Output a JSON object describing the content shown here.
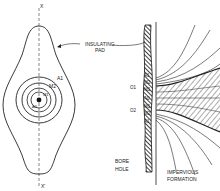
{
  "figure": {
    "left_view": {
      "axis_top_label": "X",
      "axis_bottom_label": "X'",
      "electrode_labels": [
        "A1",
        "M2",
        "M1",
        "A0"
      ]
    },
    "right_view": {
      "pad_label_line1": "INSULATING",
      "pad_label_line2": "PAD",
      "electrode_labels": [
        "A1",
        "M2",
        "O1",
        "M1",
        "A0",
        "M1",
        "O2",
        "M2",
        "A1"
      ],
      "borehole_line1": "BORE",
      "borehole_line2": "HOLE",
      "formation_line1": "IMPERVIOUS",
      "formation_line2": "FORMATION"
    },
    "colors": {
      "ink": "#222222",
      "background": "#ffffff"
    }
  }
}
